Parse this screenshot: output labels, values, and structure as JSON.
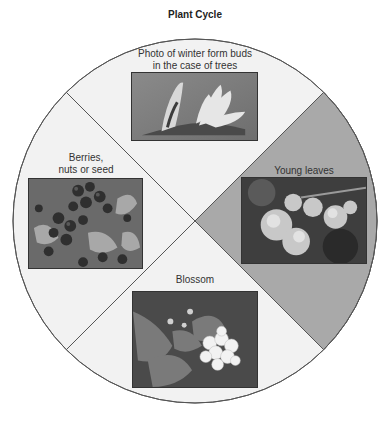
{
  "title": "Plant Cycle",
  "diagram": {
    "type": "cycle-wheel",
    "colors": {
      "light_segment": "#f2f2f2",
      "highlight_segment": "#a9a9a9",
      "outline": "#555555"
    },
    "segments": [
      {
        "position": "top",
        "label_line1": "Photo of winter form buds",
        "label_line2": "in the case of trees",
        "photo": "winter-buds-photo",
        "highlighted": false
      },
      {
        "position": "right",
        "label_line1": "Young leaves",
        "photo": "young-leaves-photo",
        "highlighted": true
      },
      {
        "position": "bottom",
        "label_line1": "Blossom",
        "photo": "blossom-photo",
        "highlighted": false
      },
      {
        "position": "left",
        "label_line1": "Berries,",
        "label_line2": "nuts or seed",
        "photo": "berries-photo",
        "highlighted": false
      }
    ]
  }
}
